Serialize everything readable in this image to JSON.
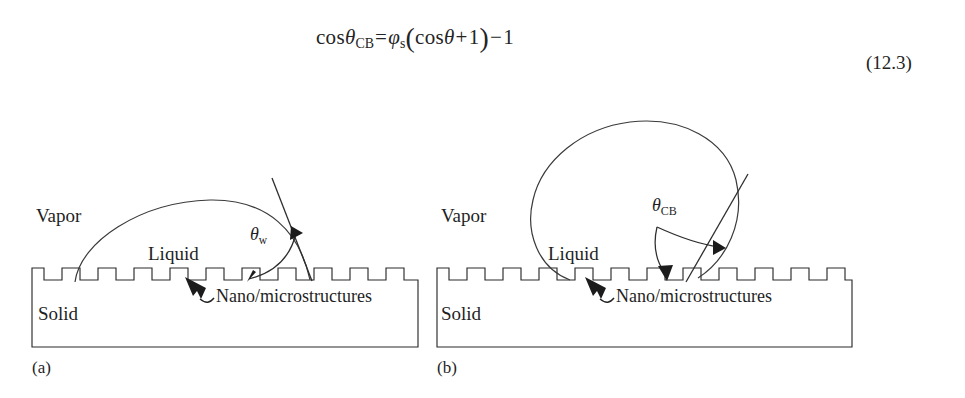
{
  "equation": {
    "number": "(12.3)",
    "plain_text": "cos θ_CB = φ_s ( cos θ + 1 ) − 1",
    "lhs_function": "cos",
    "lhs_symbol": "θ",
    "lhs_subscript": "CB",
    "equals": "=",
    "coefficient_symbol": "φ",
    "coefficient_subscript": "s",
    "open_paren": "(",
    "inner_function": "cos",
    "inner_symbol": "θ",
    "inner_plus": "+",
    "inner_one": "1",
    "close_paren": ")",
    "trailing_minus": "−",
    "trailing_one": "1"
  },
  "panels": [
    {
      "id": "a",
      "caption": "(a)",
      "state_name": "wenzel-wetting-state",
      "labels": {
        "vapor": "Vapor",
        "liquid": "Liquid",
        "solid": "Solid",
        "callout": "Nano/microstructures",
        "angle_symbol": "θ",
        "angle_subscript": "w"
      }
    },
    {
      "id": "b",
      "caption": "(b)",
      "state_name": "cassie-baxter-wetting-state",
      "labels": {
        "vapor": "Vapor",
        "liquid": "Liquid",
        "solid": "Solid",
        "callout": "Nano/microstructures",
        "angle_symbol": "θ",
        "angle_subscript": "CB"
      }
    }
  ],
  "colors": {
    "background": "#ffffff",
    "line": "#2b2b2b",
    "text": "#1f1f1f",
    "droplet_outline": "#3a3a3a"
  }
}
